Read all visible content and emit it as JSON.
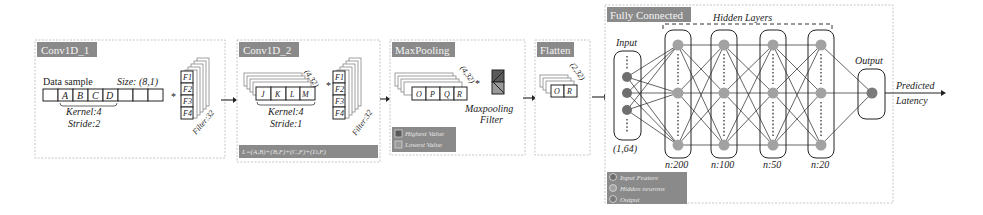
{
  "diagram": {
    "colors": {
      "tag_background": "#8a8a8a",
      "input_node": "#6e6e6e",
      "hidden_node": "#a2a2a2",
      "output_node": "#7a7a7a",
      "panel_border": "#b8b8b8"
    },
    "conv1": {
      "tag": "Conv1D_1",
      "data_sample_label": "Data sample",
      "size_label": "Size: (8,1)",
      "cells": [
        "",
        "A",
        "B",
        "C",
        "D",
        "",
        "",
        ""
      ],
      "kernel_label": "Kernel:4",
      "stride_label": "Stride:2",
      "operator": "*",
      "filter_cells": [
        "F1",
        "F2",
        "F3",
        "F4"
      ],
      "filter_count_label": "Filter:32"
    },
    "conv2": {
      "tag": "Conv1D_2",
      "shape_label": "(4,32)",
      "cells": [
        "J",
        "K",
        "L",
        "M"
      ],
      "kernel_label": "Kernel:4",
      "stride_label": "Stride:1",
      "operator": "*",
      "filter_cells": [
        "F1",
        "F2",
        "F3",
        "F4"
      ],
      "filter_count_label": "Filter:32",
      "formula": "L=(A,B)+(B,F)+(C,F)+(D,F)"
    },
    "maxpool": {
      "tag": "MaxPooling",
      "shape_label": "(4,32)",
      "cells": [
        "O",
        "P",
        "Q",
        "R"
      ],
      "operator": "*",
      "filter_label_line1": "Maxpooling",
      "filter_label_line2": "Filter",
      "legend": [
        {
          "label": "Highest Value",
          "color": "#5a5a5a"
        },
        {
          "label": "Lowest Value",
          "color": "#9a9a9a"
        }
      ]
    },
    "flatten": {
      "tag": "Flatten",
      "shape_label": "(2,32)",
      "cells": [
        "O",
        "R"
      ]
    },
    "fully_connected": {
      "tag": "Fully Connected",
      "hidden_layers_label": "Hidden Layers",
      "input_label": "Input",
      "input_shape": "(1,64)",
      "hidden_layers": [
        {
          "size_label": "n:200"
        },
        {
          "size_label": "n:100"
        },
        {
          "size_label": "n:50"
        },
        {
          "size_label": "n:20"
        }
      ],
      "output_label": "Output",
      "prediction_line1": "Predicted",
      "prediction_line2": "Latency",
      "legend": [
        {
          "label": "Input Feature",
          "color": "#6e6e6e"
        },
        {
          "label": "Hidden neurons",
          "color": "#a2a2a2"
        },
        {
          "label": "Output",
          "color": "#7a7a7a"
        }
      ]
    }
  }
}
